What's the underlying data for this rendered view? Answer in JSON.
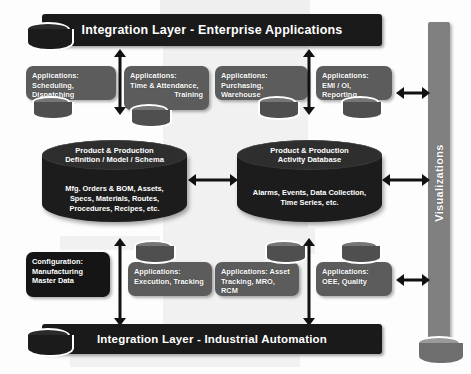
{
  "diagram": {
    "colors": {
      "integration_bar": "#1a1a1a",
      "app_box": "#5c5c5c",
      "config_box": "#151515",
      "database_cylinder": "#1c1c1c",
      "visualizations_bar": "#808080",
      "text": "#ffffff",
      "arrow": "#111111",
      "background": "#fdfdfd"
    }
  },
  "top_layer": {
    "label": "Integration Layer - Enterprise Applications"
  },
  "bottom_layer": {
    "label": "Integration Layer - Industrial Automation"
  },
  "visualizations": {
    "label": "Visualizations"
  },
  "top_boxes": [
    {
      "line1": "Applications:",
      "line2": "Scheduling, Dispatching",
      "align": "left",
      "has_cylinder": true
    },
    {
      "line1": "Applications:",
      "line2": "Time & Attendance,",
      "line3": "Training",
      "align": "left",
      "align3": "right",
      "has_cylinder": true
    },
    {
      "line1": "Applications:",
      "line2": "Purchasing, Warehouse",
      "align": "left",
      "has_cylinder": true
    },
    {
      "line1": "Applications:",
      "line2": "EMI / OI, Reporting",
      "align": "left",
      "has_cylinder": true
    }
  ],
  "bottom_boxes": [
    {
      "line1": "Configuration:",
      "line2": "Manufacturing",
      "line3": "Master Data",
      "align": "left",
      "has_cylinder": false,
      "style": "dark"
    },
    {
      "line1": "Applications:",
      "line2": "Execution, Tracking",
      "align": "left",
      "has_cylinder": true
    },
    {
      "line1": "Applications: Asset",
      "line2": "Tracking, MRO, RCM",
      "align": "left",
      "has_cylinder": true
    },
    {
      "line1": "Applications:",
      "line2": "OEE, Quality",
      "align": "left",
      "has_cylinder": true
    }
  ],
  "databases": [
    {
      "title_line1": "Product & Production",
      "title_line2": "Definition / Model / Schema",
      "body_line1": "Mfg. Orders & BOM, Assets,",
      "body_line2": "Specs, Materials, Routes,",
      "body_line3": "Procedures, Recipes, etc."
    },
    {
      "title_line1": "Product & Production",
      "title_line2": "Activity Database",
      "body_line1": "Alarms, Events, Data Collection,",
      "body_line2": "Time Series, etc.",
      "body_line3": ""
    }
  ],
  "arrows": {
    "between_databases": "bidirectional",
    "top_left_to_layer": "bidirectional",
    "top_right_to_layer": "bidirectional",
    "bottom_left_to_layer": "bidirectional",
    "bottom_right_to_layer": "bidirectional",
    "top_to_visualizations": "bidirectional",
    "middle_to_visualizations": "bidirectional",
    "bottom_to_visualizations": "bidirectional"
  }
}
